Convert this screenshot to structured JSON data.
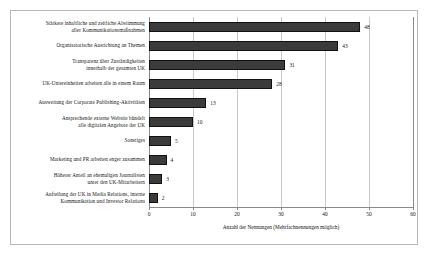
{
  "chart_data": {
    "type": "bar",
    "orientation": "horizontal",
    "title": "",
    "xlabel": "Anzahl der Nennungen (Mehrfachnennungen möglich)",
    "ylabel": "",
    "xlim": [
      0,
      60
    ],
    "xticks": [
      0,
      10,
      20,
      30,
      40,
      50,
      60
    ],
    "grid": true,
    "legend": false,
    "bar_color": "#3b3b3b",
    "categories": [
      "Stärkere inhaltliche und zeitliche Abstimmung aller Kommunikationsmaßnahmen",
      "Organisatorische Ausrichtung an Themen",
      "Transparenz über Zuständigkeiten innerhalb der gesamten UK",
      "UK-Untereinheiten arbeiten alle in einem Raum",
      "Ausweitung der Corporate Publishing-Aktivitäten",
      "Ansprechende externe Website bündelt alle digitalen Angebote der UK",
      "Sonstiges",
      "Marketing und PR arbeiten enger zusammen",
      "Höherer Anteil an ehemaligen Journalisten unter den UK-Mitarbeitern",
      "Aufteilung der UK in Media Relations, interne Kommunikation und Investor Relations"
    ],
    "category_lines": [
      [
        "Stärkere inhaltliche und zeitliche Abstimmung",
        "aller Kommunikationsmaßnahmen"
      ],
      [
        "Organisatorische Ausrichtung an Themen"
      ],
      [
        "Transparenz über Zuständigkeiten",
        "innerhalb der gesamten UK"
      ],
      [
        "UK-Untereinheiten arbeiten alle in einem Raum"
      ],
      [
        "Ausweitung der Corporate Publishing-Aktivitäten"
      ],
      [
        "Ansprechende externe Website bündelt",
        "alle digitalen Angebote der UK"
      ],
      [
        "Sonstiges"
      ],
      [
        "Marketing und PR arbeiten enger zusammen"
      ],
      [
        "Höherer Anteil an ehemaligen Journalisten",
        "unter den UK-Mitarbeitern"
      ],
      [
        "Aufteilung der UK in Media Relations, interne",
        "Kommunikation und Investor Relations"
      ]
    ],
    "values": [
      48,
      43,
      31,
      28,
      13,
      10,
      5,
      4,
      3,
      2
    ]
  }
}
